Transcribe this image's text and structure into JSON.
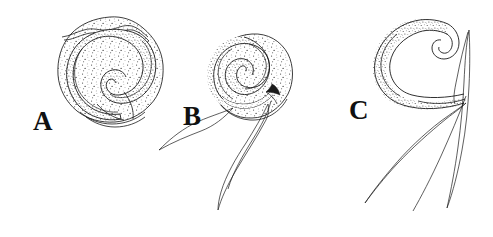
{
  "figure": {
    "background_color": "#ffffff",
    "ink_color": "#1a1a1a",
    "width_px": 493,
    "height_px": 237,
    "panels": [
      {
        "id": "a",
        "label": "A",
        "caption": "Larva coiled within rounded cyst",
        "label_x": 33,
        "label_y": 108
      },
      {
        "id": "b",
        "label": "B",
        "caption": "Larva coiled in cyst with tail emerging",
        "label_x": 183,
        "label_y": 103
      },
      {
        "id": "c",
        "label": "C",
        "caption": "Free larva, anterior coiled, long tapering tail",
        "label_x": 349,
        "label_y": 97
      }
    ]
  }
}
